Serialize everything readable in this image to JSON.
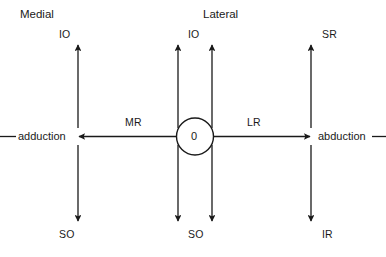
{
  "figure": {
    "type": "diagram",
    "background_color": "#ffffff",
    "line_color": "#1a1a1a",
    "text_color": "#1a1a1a"
  },
  "headers": {
    "medial": "Medial",
    "lateral": "Lateral"
  },
  "center": {
    "origin_label": "0"
  },
  "horizontal_axis": {
    "left_end_label": "adduction",
    "right_end_label": "abduction",
    "left_muscle_label": "MR",
    "right_muscle_label": "LR"
  },
  "columns": [
    {
      "name": "medial-column",
      "top_label": "IO",
      "bottom_label": "SO"
    },
    {
      "name": "center-left-column",
      "top_label": "IO",
      "bottom_label": "SO"
    },
    {
      "name": "center-right-column",
      "top_label": "IO",
      "bottom_label": "SO"
    },
    {
      "name": "lateral-column",
      "top_label": "SR",
      "bottom_label": "IR"
    }
  ],
  "labels": {
    "medial_top": "IO",
    "medial_bottom": "SO",
    "center_top": "IO",
    "center_bottom": "SO",
    "lateral_top": "SR",
    "lateral_bottom": "IR"
  }
}
